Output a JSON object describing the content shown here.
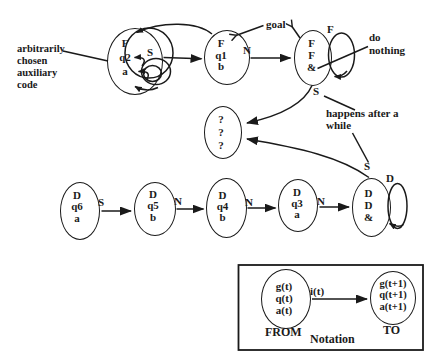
{
  "figure": {
    "aux_note": {
      "lines": [
        "arbitrarily",
        "chosen",
        "auxiliary",
        "code"
      ]
    },
    "goal_label": "goal",
    "do_nothing_note": {
      "lines": [
        "do",
        "nothing"
      ]
    },
    "after_while_note": {
      "lines": [
        "happens after a",
        "while"
      ]
    },
    "states": {
      "aux": {
        "lines": [
          "F",
          "q2",
          "a"
        ]
      },
      "q1": {
        "lines": [
          "F",
          "q1",
          "b"
        ]
      },
      "ff_amp": {
        "lines": [
          "F",
          "F",
          "&"
        ]
      },
      "unknown": {
        "lines": [
          "?",
          "?",
          "?"
        ]
      },
      "q6": {
        "lines": [
          "D",
          "q6",
          "a"
        ]
      },
      "q5": {
        "lines": [
          "D",
          "q5",
          "b"
        ]
      },
      "q4": {
        "lines": [
          "D",
          "q4",
          "b"
        ]
      },
      "q3": {
        "lines": [
          "D",
          "q3",
          "a"
        ]
      },
      "dd_amp": {
        "lines": [
          "D",
          "D",
          "&"
        ]
      }
    },
    "transition_labels": {
      "aux_s": "S",
      "q1_n": "N",
      "ff_self_f": "F",
      "ff_s": "S",
      "dd_s": "S",
      "q6_s": "S",
      "q5_n": "N",
      "q4_n": "N",
      "q3_n": "N",
      "dd_self_d": "D"
    },
    "notation": {
      "from_state": {
        "lines": [
          "g(t)",
          "q(t)",
          "a(t)"
        ]
      },
      "to_state": {
        "lines": [
          "g(t+1)",
          "q(t+1)",
          "a(t+1)"
        ]
      },
      "input_label": "i(t)",
      "from_label": "FROM",
      "to_label": "TO",
      "caption": "Notation"
    },
    "colors": {
      "ink": "#1a1a1a",
      "background": "#ffffff"
    }
  }
}
